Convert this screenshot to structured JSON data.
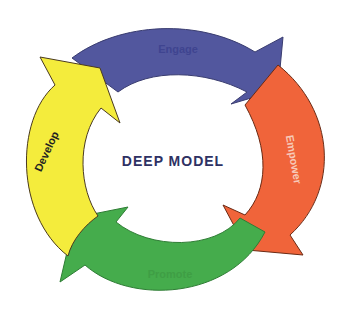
{
  "diagram": {
    "title": "DEEP MODEL",
    "type": "cycle",
    "stages": [
      {
        "label": "Engage",
        "color": "#52579e",
        "text_color": "#3f4490",
        "direction": "clockwise"
      },
      {
        "label": "Empower",
        "color": "#f0643a",
        "text_color": "#f7c9b8",
        "direction": "clockwise"
      },
      {
        "label": "Promote",
        "color": "#45ac4c",
        "text_color": "#3f9e45",
        "direction": "clockwise"
      },
      {
        "label": "Develop",
        "color": "#f4ec3c",
        "text_color": "#222222",
        "direction": "clockwise"
      }
    ],
    "title_color": "#2e3163",
    "outline_color": "#4a3a20"
  }
}
